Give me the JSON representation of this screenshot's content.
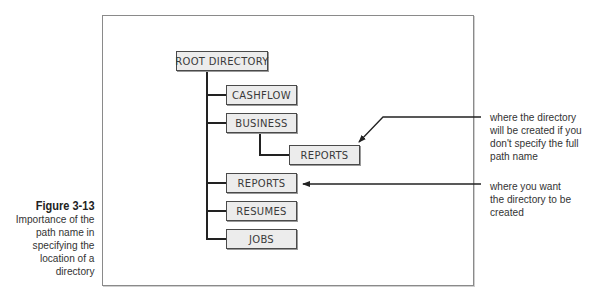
{
  "caption": {
    "figure_label": "Figure 3-13",
    "lines": [
      "Importance of the",
      "path name in",
      "specifying the",
      "location of a",
      "directory"
    ]
  },
  "tree": {
    "root": "ROOT DIRECTORY",
    "children": [
      {
        "label": "CASHFLOW"
      },
      {
        "label": "BUSINESS",
        "children": [
          {
            "label": "REPORTS"
          }
        ]
      },
      {
        "label": "REPORTS"
      },
      {
        "label": "RESUMES"
      },
      {
        "label": "JOBS"
      }
    ]
  },
  "annotations": [
    {
      "target": "BUSINESS/REPORTS",
      "lines": [
        "where the directory",
        "will be created if you",
        "don't specify the full",
        "path name"
      ]
    },
    {
      "target": "REPORTS",
      "lines": [
        "where you want",
        "the directory to be",
        "created"
      ]
    }
  ],
  "colors": {
    "node_fill": "#ececec",
    "node_border": "#4a4a4a",
    "line": "#222222",
    "frame": "#8a8a8a"
  }
}
